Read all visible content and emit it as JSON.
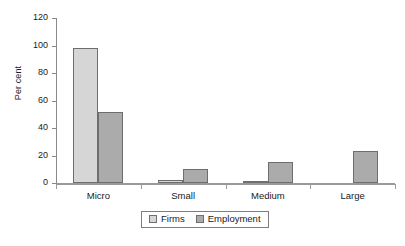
{
  "chart_data": {
    "type": "bar",
    "title": "",
    "subtitle": "",
    "xlabel": "",
    "ylabel": "Per cent",
    "categories": [
      "Micro",
      "Small",
      "Medium",
      "Large"
    ],
    "series": [
      {
        "name": "Firms",
        "values": [
          98,
          2,
          0.5,
          0
        ],
        "color": "#d6d6d6"
      },
      {
        "name": "Employment",
        "values": [
          52,
          10,
          15,
          23
        ],
        "color": "#ababab"
      }
    ],
    "ylim": [
      0,
      120
    ],
    "ytick_labels": [
      "0",
      "20",
      "40",
      "60",
      "80",
      "100",
      "120"
    ],
    "ytick_values": [
      0,
      20,
      40,
      60,
      80,
      100,
      120
    ],
    "grid": false,
    "legend_position": "bottom",
    "legend_entries": [
      "Firms",
      "Employment"
    ]
  }
}
